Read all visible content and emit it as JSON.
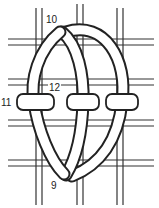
{
  "diagram": {
    "type": "needlework-stitch-diagram",
    "labels": [
      {
        "id": "10",
        "text": "10",
        "x": 46,
        "y": 23
      },
      {
        "id": "12",
        "text": "12",
        "x": 49,
        "y": 91
      },
      {
        "id": "11",
        "text": "11",
        "x": 1,
        "y": 106
      },
      {
        "id": "9",
        "text": "9",
        "x": 51,
        "y": 189
      }
    ],
    "colors": {
      "line": "#222222",
      "fill": "#ffffff"
    }
  }
}
